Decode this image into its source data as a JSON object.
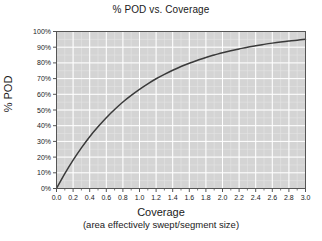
{
  "chart_data": {
    "type": "line",
    "title": "% POD vs. Coverage",
    "xlabel": "Coverage",
    "xlabel_sub": "(area effectively swept/segment size)",
    "ylabel": "% POD",
    "xlim": [
      0.0,
      3.0
    ],
    "ylim": [
      0,
      100
    ],
    "grid": true,
    "legend": "none",
    "x_ticks": [
      "0.0",
      "0.2",
      "0.4",
      "0.6",
      "0.8",
      "1.0",
      "1.2",
      "1.4",
      "1.6",
      "1.8",
      "2.0",
      "2.2",
      "2.4",
      "2.6",
      "2.8",
      "3.0"
    ],
    "x_tick_values": [
      0.0,
      0.2,
      0.4,
      0.6,
      0.8,
      1.0,
      1.2,
      1.4,
      1.6,
      1.8,
      2.0,
      2.2,
      2.4,
      2.6,
      2.8,
      3.0
    ],
    "x_minor_step": 0.1,
    "y_ticks": [
      "0%",
      "10%",
      "20%",
      "30%",
      "40%",
      "50%",
      "60%",
      "70%",
      "80%",
      "90%",
      "100%"
    ],
    "y_tick_values": [
      0,
      10,
      20,
      30,
      40,
      50,
      60,
      70,
      80,
      90,
      100
    ],
    "series": [
      {
        "name": "% POD",
        "color": "#3a3a3a",
        "x": [
          0.0,
          0.1,
          0.2,
          0.3,
          0.4,
          0.5,
          0.6,
          0.7,
          0.8,
          0.9,
          1.0,
          1.1,
          1.2,
          1.3,
          1.4,
          1.5,
          1.6,
          1.7,
          1.8,
          1.9,
          2.0,
          2.1,
          2.2,
          2.3,
          2.4,
          2.5,
          2.6,
          2.7,
          2.8,
          2.9,
          3.0
        ],
        "values": [
          0.0,
          9.5,
          18.1,
          25.9,
          33.0,
          39.3,
          45.1,
          50.3,
          55.1,
          59.3,
          63.2,
          66.7,
          69.9,
          72.7,
          75.3,
          77.7,
          79.8,
          81.7,
          83.5,
          85.0,
          86.5,
          87.8,
          88.9,
          90.0,
          90.9,
          91.8,
          92.6,
          93.3,
          93.9,
          94.5,
          95.0
        ]
      }
    ]
  },
  "colors": {
    "plot_background": "#d4d4d4",
    "gridline_major": "#ffffff",
    "gridline_minor": "#e4e4e4",
    "axis": "#555555",
    "curve": "#3a3a3a",
    "text": "#1a1a1a"
  }
}
